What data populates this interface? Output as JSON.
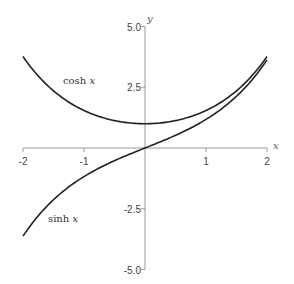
{
  "chart_data": {
    "type": "line",
    "title": "",
    "xlabel": "x",
    "ylabel": "y",
    "xlim": [
      -2,
      2
    ],
    "ylim": [
      -5,
      5
    ],
    "grid": false,
    "legend": "inline labels",
    "x_ticks": [
      -2,
      -1,
      1,
      2
    ],
    "x_tick_labels": [
      "-2",
      "-1",
      "1",
      "2"
    ],
    "y_ticks": [
      5.0,
      2.5,
      -2.5,
      -5.0
    ],
    "y_tick_labels": [
      "5.0",
      "2.5",
      "-2.5",
      "-5.0"
    ],
    "x": [
      -2,
      -1.5,
      -1,
      -0.5,
      0,
      0.5,
      1,
      1.5,
      2
    ],
    "series": [
      {
        "name": "cosh x",
        "label_func": "cosh",
        "label_var": "x",
        "values": [
          3.76,
          2.35,
          1.54,
          1.13,
          1.0,
          1.13,
          1.54,
          2.35,
          3.76
        ]
      },
      {
        "name": "sinh x",
        "label_func": "sinh",
        "label_var": "x",
        "values": [
          -3.63,
          -2.13,
          -1.18,
          -0.52,
          0.0,
          0.52,
          1.18,
          2.13,
          3.63
        ]
      }
    ]
  }
}
